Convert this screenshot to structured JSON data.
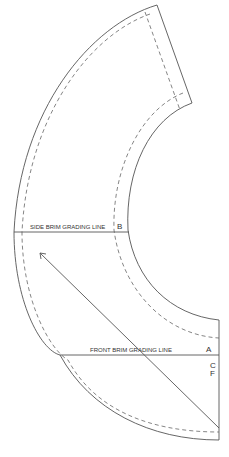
{
  "pattern": {
    "side_grading_label": "SIDE BRIM GRADING LINE",
    "front_grading_label": "FRONT BRIM GRADING LINE",
    "point_a": "A",
    "point_b": "B",
    "cf_c": "C",
    "cf_f": "F"
  }
}
